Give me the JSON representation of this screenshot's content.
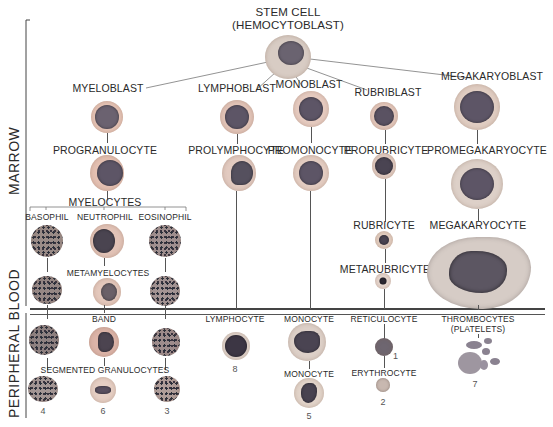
{
  "title": {
    "line1": "STEM CELL",
    "line2": "(HEMOCYTOBLAST)"
  },
  "regions": {
    "marrow": "MARROW",
    "peripheral_blood": "PERIPHERAL BLOOD"
  },
  "lineages": {
    "granulocytic": {
      "blast": "MYELOBLAST",
      "pro": "PROGRANULOCYTE",
      "myelocytes": "MYELOCYTES",
      "types": [
        "BASOPHIL",
        "NEUTROPHIL",
        "EOSINOPHIL"
      ],
      "metamyelocytes": "METAMYELOCYTES",
      "band": "BAND",
      "segmented": "SEGMENTED GRANULOCYTES",
      "numbers": [
        "4",
        "6",
        "3"
      ]
    },
    "lymphocytic": {
      "blast": "LYMPHOBLAST",
      "pro": "PROLYMPHOCYTE",
      "mature": "LYMPHOCYTE",
      "number": "8"
    },
    "monocytic": {
      "blast": "MONOBLAST",
      "pro": "PROMONOCYTE",
      "mature1": "MONOCYTE",
      "mature2": "MONOCYTE",
      "number": "5"
    },
    "erythrocytic": {
      "blast": "RUBRIBLAST",
      "pro": "PRORUBRICYTE",
      "rubricyte": "RUBRICYTE",
      "metarubricyte": "METARUBRICYTE",
      "reticulocyte": "RETICULOCYTE",
      "reticulocyte_number": "1",
      "erythrocyte": "ERYTHROCYTE",
      "erythrocyte_number": "2"
    },
    "megakaryocytic": {
      "blast": "MEGAKARYOBLAST",
      "pro": "PROMEGAKARYOCYTE",
      "mature": "MEGAKARYOCYTE",
      "platelets_line1": "THROMBOCYTES",
      "platelets_line2": "(PLATELETS)",
      "number": "7"
    }
  },
  "colors": {
    "cytoplasm_pink": "#e8c4b4",
    "cytoplasm_light": "#ead7cc",
    "nucleus_purple": "#5d5566",
    "nucleus_dark": "#3c3644",
    "divider": "#444444"
  }
}
